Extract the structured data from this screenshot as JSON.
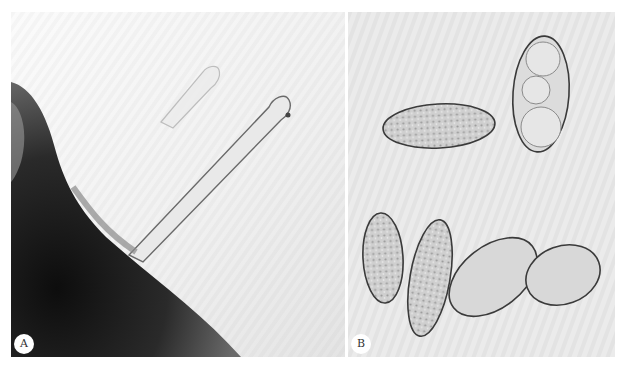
{
  "figure": {
    "panels": [
      {
        "id": "A",
        "label": "A",
        "content": "germinating hyphae emerging from dark host tissue",
        "colors": {
          "background": "#f2f2f2",
          "tissue": "#1a1a1a",
          "hypha_outline": "#5a5a5a"
        }
      },
      {
        "id": "B",
        "label": "B",
        "content": "six elliptical spores / conidia with granular contents",
        "spore_count": 6,
        "colors": {
          "background": "#ececec",
          "spore_fill": "#cfcfcf",
          "spore_outline": "#3a3a3a"
        }
      }
    ]
  }
}
